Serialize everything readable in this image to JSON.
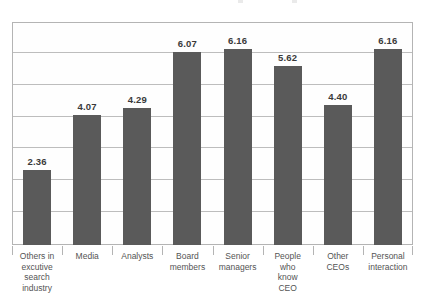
{
  "chart_data": {
    "type": "bar",
    "title": "",
    "subtitle": "",
    "xlabel": "",
    "ylabel": "",
    "ylim": [
      0,
      7
    ],
    "grid": true,
    "gridlines": [
      1,
      2,
      3,
      4,
      5,
      6
    ],
    "y_tick_labels": [],
    "legend": null,
    "legend_position": "none",
    "bar_color": "#5a5a5a",
    "frame_color": "#b4b4b4",
    "gridline_color": "#bdbdbd",
    "value_label_format": "0.00",
    "categories": [
      "Others in excutive search industry",
      "Media",
      "Analysts",
      "Board members",
      "Senior managers",
      "People who know CEO",
      "Other CEOs",
      "Personal interaction"
    ],
    "category_lines": [
      [
        "Others in",
        "excutive",
        "search",
        "industry"
      ],
      [
        "Media"
      ],
      [
        "Analysts"
      ],
      [
        "Board",
        "members"
      ],
      [
        "Senior",
        "managers"
      ],
      [
        "People",
        "who",
        "know",
        "CEO"
      ],
      [
        "Other",
        "CEOs"
      ],
      [
        "Personal",
        "interaction"
      ]
    ],
    "values": [
      2.36,
      4.07,
      4.29,
      6.07,
      6.16,
      5.62,
      4.4,
      6.16
    ],
    "value_labels": [
      "2.36",
      "4.07",
      "4.29",
      "6.07",
      "6.16",
      "5.62",
      "4.40",
      "6.16"
    ]
  }
}
